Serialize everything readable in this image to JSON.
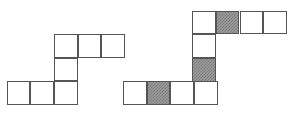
{
  "figure": {
    "cell_size": 23.7,
    "colors": {
      "background": "#ffffff",
      "stroke": "#555555",
      "shaded_fill": "#9a9a9a",
      "shaded_hatch": "#7d7d7d",
      "empty_fill": "#ffffff"
    },
    "shapes": [
      {
        "name": "left-shape",
        "origin": {
          "x": 6.0,
          "y": 34.0
        },
        "cell_count": 7,
        "shaded_count": 0,
        "cells": [
          {
            "name": "cell-r0c2",
            "row": 0,
            "col": 2,
            "x": 54.0,
            "y": 34.0,
            "w": 23.7,
            "h": 23.7,
            "shaded": false
          },
          {
            "name": "cell-r0c3",
            "row": 0,
            "col": 3,
            "x": 77.7,
            "y": 34.0,
            "w": 23.7,
            "h": 23.7,
            "shaded": false
          },
          {
            "name": "cell-r0c4",
            "row": 0,
            "col": 4,
            "x": 101.4,
            "y": 34.0,
            "w": 23.7,
            "h": 23.7,
            "shaded": false
          },
          {
            "name": "cell-r1c2",
            "row": 1,
            "col": 2,
            "x": 54.0,
            "y": 57.7,
            "w": 23.7,
            "h": 23.7,
            "shaded": false
          },
          {
            "name": "cell-r2c0",
            "row": 2,
            "col": 0,
            "x": 6.6,
            "y": 81.4,
            "w": 23.7,
            "h": 23.7,
            "shaded": false
          },
          {
            "name": "cell-r2c1",
            "row": 2,
            "col": 1,
            "x": 30.3,
            "y": 81.4,
            "w": 23.7,
            "h": 23.7,
            "shaded": false
          },
          {
            "name": "cell-r2c2",
            "row": 2,
            "col": 2,
            "x": 54.0,
            "y": 81.4,
            "w": 23.7,
            "h": 23.7,
            "shaded": false
          }
        ]
      },
      {
        "name": "right-shape",
        "origin": {
          "x": 123.0,
          "y": 10.7
        },
        "cell_count": 10,
        "shaded_count": 3,
        "cells": [
          {
            "name": "cell-r0c3",
            "row": 0,
            "col": 3,
            "x": 192.1,
            "y": 10.7,
            "w": 23.7,
            "h": 23.7,
            "shaded": false
          },
          {
            "name": "cell-r0c4",
            "row": 0,
            "col": 4,
            "x": 215.8,
            "y": 10.7,
            "w": 23.7,
            "h": 23.7,
            "shaded": true
          },
          {
            "name": "cell-r0c5",
            "row": 0,
            "col": 5,
            "x": 239.5,
            "y": 10.7,
            "w": 23.7,
            "h": 23.7,
            "shaded": false
          },
          {
            "name": "cell-r0c6",
            "row": 0,
            "col": 6,
            "x": 263.2,
            "y": 10.7,
            "w": 23.7,
            "h": 23.7,
            "shaded": false
          },
          {
            "name": "cell-r1c3",
            "row": 1,
            "col": 3,
            "x": 192.1,
            "y": 34.4,
            "w": 23.7,
            "h": 23.7,
            "shaded": false
          },
          {
            "name": "cell-r2c3",
            "row": 2,
            "col": 3,
            "x": 192.1,
            "y": 58.1,
            "w": 23.7,
            "h": 23.7,
            "shaded": true
          },
          {
            "name": "cell-r3c0",
            "row": 3,
            "col": 0,
            "x": 123.0,
            "y": 81.4,
            "w": 23.7,
            "h": 23.7,
            "shaded": false
          },
          {
            "name": "cell-r3c1",
            "row": 3,
            "col": 1,
            "x": 146.7,
            "y": 81.4,
            "w": 23.7,
            "h": 23.7,
            "shaded": true
          },
          {
            "name": "cell-r3c2",
            "row": 3,
            "col": 2,
            "x": 170.4,
            "y": 81.4,
            "w": 23.7,
            "h": 23.7,
            "shaded": false
          },
          {
            "name": "cell-r3c3",
            "row": 3,
            "col": 3,
            "x": 194.1,
            "y": 81.4,
            "w": 23.7,
            "h": 23.7,
            "shaded": false
          }
        ]
      }
    ]
  }
}
